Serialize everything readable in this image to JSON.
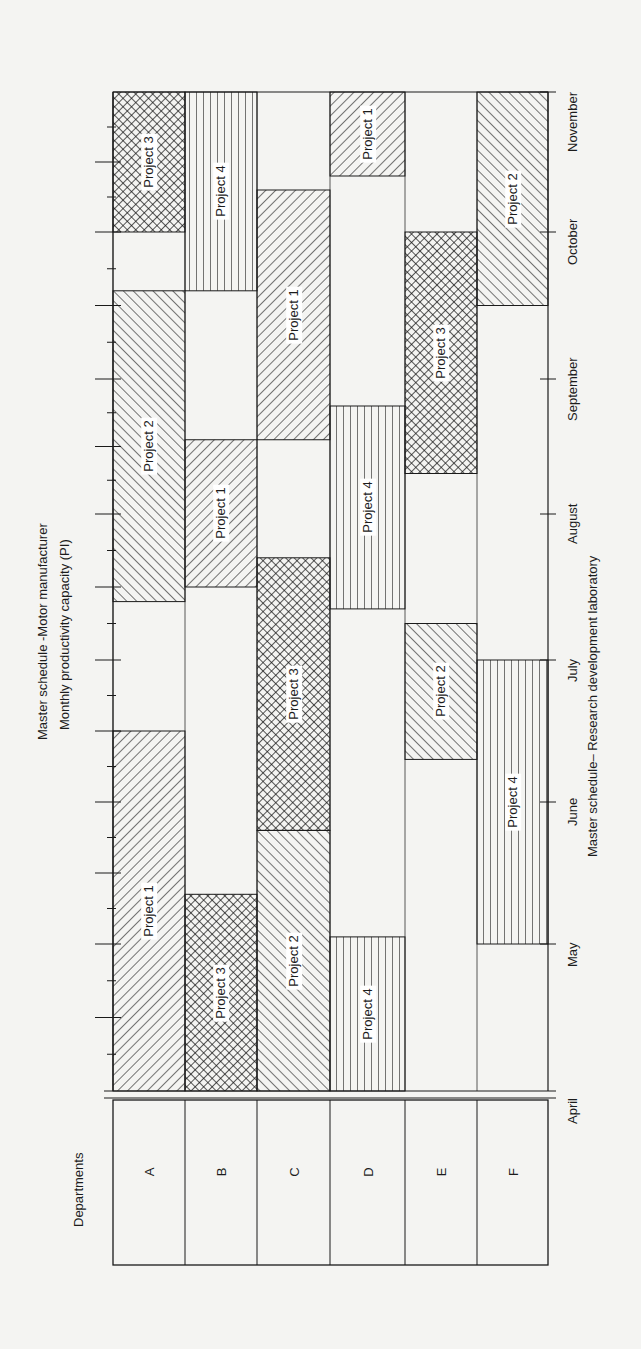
{
  "chart_data": {
    "type": "gantt",
    "orientation": "rotated-90ccw",
    "title": "Master schedule -Motor manufacturer",
    "subtitle": "Monthly productivity capacity (PI)",
    "xlabel": "Master schedule– Research development laboratory",
    "row_header": "Departments",
    "rows": [
      "A",
      "B",
      "C",
      "D",
      "E",
      "F"
    ],
    "months": [
      "April",
      "May",
      "June",
      "July",
      "August",
      "September",
      "October",
      "November"
    ],
    "time_unit": "months from start of April (0 = April start, 7 = November start)",
    "projects": {
      "Project 1": {
        "pattern": "diagonal-back"
      },
      "Project 2": {
        "pattern": "diagonal-forward"
      },
      "Project 3": {
        "pattern": "crosshatch"
      },
      "Project 4": {
        "pattern": "horizontal-lines"
      }
    },
    "bars": [
      {
        "row": "A",
        "project": "Project 1",
        "start": 0.0,
        "end": 2.5
      },
      {
        "row": "A",
        "project": "Project 2",
        "start": 3.4,
        "end": 5.6
      },
      {
        "row": "A",
        "project": "Project 3",
        "start": 6.0,
        "end": 7.0
      },
      {
        "row": "B",
        "project": "Project 3",
        "start": 0.0,
        "end": 1.35
      },
      {
        "row": "B",
        "project": "Project 1",
        "start": 3.5,
        "end": 4.55
      },
      {
        "row": "B",
        "project": "Project 4",
        "start": 5.6,
        "end": 7.0
      },
      {
        "row": "C",
        "project": "Project 2",
        "start": 0.0,
        "end": 1.8
      },
      {
        "row": "C",
        "project": "Project 3",
        "start": 1.8,
        "end": 3.7
      },
      {
        "row": "C",
        "project": "Project 1",
        "start": 4.55,
        "end": 6.3
      },
      {
        "row": "D",
        "project": "Project 4",
        "start": 0.0,
        "end": 1.05
      },
      {
        "row": "D",
        "project": "Project 4",
        "start": 3.35,
        "end": 4.8
      },
      {
        "row": "D",
        "project": "Project 1",
        "start": 6.4,
        "end": 7.0
      },
      {
        "row": "E",
        "project": "Project 2",
        "start": 2.3,
        "end": 3.25
      },
      {
        "row": "E",
        "project": "Project 3",
        "start": 4.3,
        "end": 6.0
      },
      {
        "row": "F",
        "project": "Project 4",
        "start": 1.0,
        "end": 3.0
      },
      {
        "row": "F",
        "project": "Project 2",
        "start": 5.5,
        "end": 7.0
      }
    ],
    "grid": false,
    "legend": "none (labels inside bars)"
  },
  "labels": {
    "title": "Master schedule -Motor manufacturer",
    "subtitle": "Monthly productivity capacity (PI)",
    "xlabel": "Master schedule– Research development laboratory",
    "row_header": "Departments"
  }
}
